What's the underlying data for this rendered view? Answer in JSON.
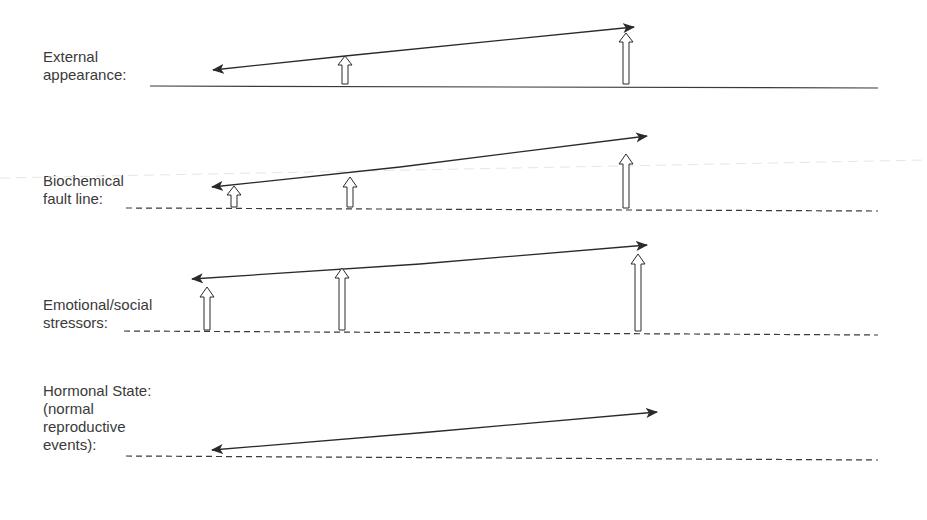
{
  "diagram": {
    "layers": [
      {
        "id": "external",
        "label": "External\nappearance:",
        "baseline_style": "solid"
      },
      {
        "id": "biochemical",
        "label": "Biochemical\nfault line:",
        "baseline_style": "dashed"
      },
      {
        "id": "emotional",
        "label": "Emotional/social\nstressors:",
        "baseline_style": "dashed"
      },
      {
        "id": "hormonal",
        "label": "Hormonal State:\n(normal\nreproductive\nevents):",
        "baseline_style": "dashed"
      }
    ],
    "colors": {
      "line": "#2a2a2a",
      "text": "#3a3a3a",
      "background": "#ffffff"
    }
  }
}
